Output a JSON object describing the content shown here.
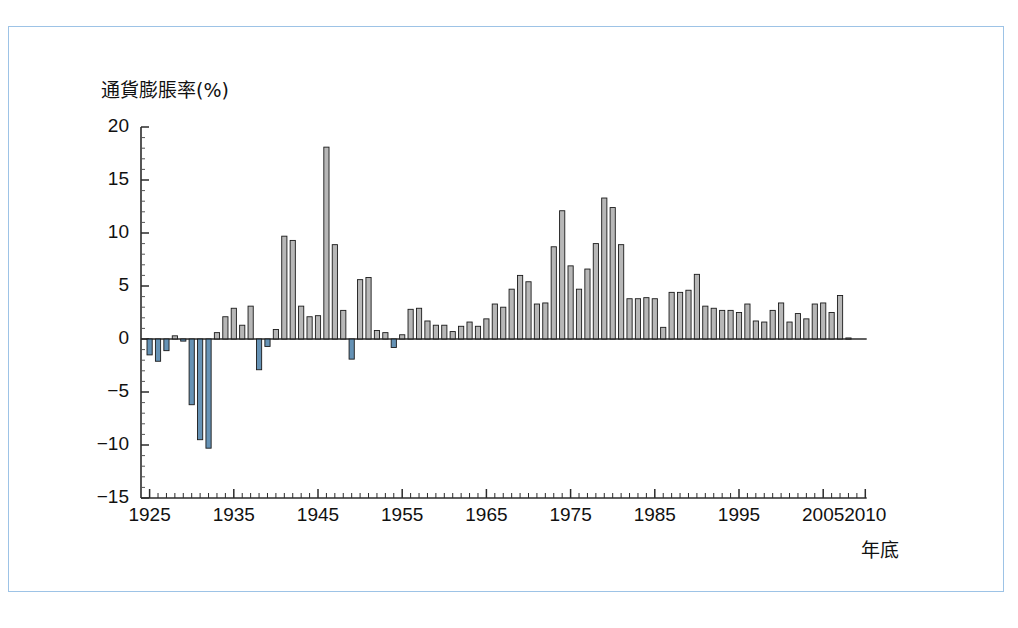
{
  "figure": {
    "frame_color": "#9dc3e6",
    "background": "#ffffff"
  },
  "chart_data": {
    "type": "bar",
    "title": "",
    "subtitle": "",
    "ylabel": "通貨膨脹率(%)",
    "xlabel": "年底",
    "ylim": [
      -15,
      20
    ],
    "xlim": [
      1924,
      2010
    ],
    "grid": false,
    "legend": null,
    "ytick_labels": [
      "20",
      "15",
      "10",
      "5",
      "0",
      "−5",
      "−10",
      "−15"
    ],
    "ytick_values": [
      20,
      15,
      10,
      5,
      0,
      -5,
      -10,
      -15
    ],
    "xtick_labels": [
      "1925",
      "1935",
      "1945",
      "1955",
      "1965",
      "1975",
      "1985",
      "1995",
      "2005",
      "2010"
    ],
    "xtick_values": [
      1925,
      1935,
      1945,
      1955,
      1965,
      1975,
      1985,
      1995,
      2005,
      2010
    ],
    "minor_tick_interval": 1,
    "positive_bar_color": "#8a8a8a",
    "negative_bar_color": "#4a7fa8",
    "bar_edge_color": "#1a1a1a",
    "categories": [
      1925,
      1926,
      1927,
      1928,
      1929,
      1930,
      1931,
      1932,
      1933,
      1934,
      1935,
      1936,
      1937,
      1938,
      1939,
      1940,
      1941,
      1942,
      1943,
      1944,
      1945,
      1946,
      1947,
      1948,
      1949,
      1950,
      1951,
      1952,
      1953,
      1954,
      1955,
      1956,
      1957,
      1958,
      1959,
      1960,
      1961,
      1962,
      1963,
      1964,
      1965,
      1966,
      1967,
      1968,
      1969,
      1970,
      1971,
      1972,
      1973,
      1974,
      1975,
      1976,
      1977,
      1978,
      1979,
      1980,
      1981,
      1982,
      1983,
      1984,
      1985,
      1986,
      1987,
      1988,
      1989,
      1990,
      1991,
      1992,
      1993,
      1994,
      1995,
      1996,
      1997,
      1998,
      1999,
      2000,
      2001,
      2002,
      2003,
      2004,
      2005,
      2006,
      2007,
      2008
    ],
    "values": [
      -1.5,
      -2.1,
      -1.1,
      0.3,
      -0.2,
      -6.2,
      -9.5,
      -10.3,
      0.6,
      2.1,
      2.9,
      1.3,
      3.1,
      -2.9,
      -0.7,
      0.9,
      9.7,
      9.3,
      3.1,
      2.1,
      2.2,
      18.1,
      8.9,
      2.7,
      -1.9,
      5.6,
      5.8,
      0.8,
      0.6,
      -0.8,
      0.4,
      2.8,
      2.9,
      1.7,
      1.3,
      1.3,
      0.7,
      1.2,
      1.6,
      1.2,
      1.9,
      3.3,
      3.0,
      4.7,
      6.0,
      5.4,
      3.3,
      3.4,
      8.7,
      12.1,
      6.9,
      4.7,
      6.6,
      9.0,
      13.3,
      12.4,
      8.9,
      3.8,
      3.8,
      3.9,
      3.8,
      1.1,
      4.4,
      4.4,
      4.6,
      6.1,
      3.1,
      2.9,
      2.7,
      2.7,
      2.5,
      3.3,
      1.7,
      1.6,
      2.7,
      3.4,
      1.6,
      2.4,
      1.9,
      3.3,
      3.4,
      2.5,
      4.1,
      0.1
    ],
    "negative_indices": [
      0,
      1,
      2,
      4,
      5,
      6,
      7,
      13,
      14,
      24,
      29
    ],
    "annotations": []
  },
  "axis": {
    "y_title": "通貨膨脹率(%)",
    "x_title": "年底"
  }
}
